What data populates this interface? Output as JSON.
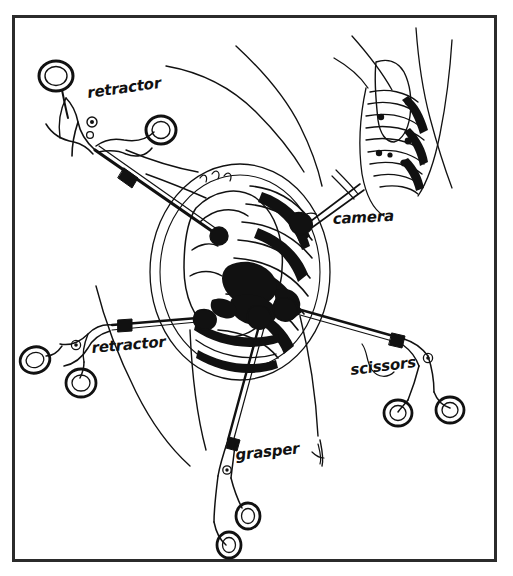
{
  "figure": {
    "kind": "line-drawing",
    "border_color": "#2b2b2b",
    "ink_color": "#111111",
    "background_color": "#ffffff",
    "frame": {
      "x": 13,
      "y": 16,
      "width": 483,
      "height": 545
    }
  },
  "labels": [
    {
      "id": "retractor-upper",
      "text": "retractor",
      "x": 88,
      "y": 98,
      "rotation": -8,
      "font_size": 15
    },
    {
      "id": "camera",
      "text": "camera",
      "x": 333,
      "y": 224,
      "rotation": -3,
      "font_size": 15
    },
    {
      "id": "retractor-lower",
      "text": "retractor",
      "x": 92,
      "y": 353,
      "rotation": -5,
      "font_size": 15
    },
    {
      "id": "scissors",
      "text": "scissors",
      "x": 351,
      "y": 375,
      "rotation": -7,
      "font_size": 15
    },
    {
      "id": "grasper",
      "text": "grasper",
      "x": 236,
      "y": 460,
      "rotation": -6,
      "font_size": 15
    }
  ],
  "instruments": [
    {
      "id": "retractor-upper",
      "name": "retractor",
      "handle_position": "top-left",
      "handle_type": "ring-handle",
      "ring_count": 2,
      "entry_point": {
        "x": 219,
        "y": 236
      }
    },
    {
      "id": "retractor-lower",
      "name": "retractor",
      "handle_position": "bottom-left",
      "handle_type": "ring-handle",
      "ring_count": 2,
      "entry_point": {
        "x": 210,
        "y": 317
      }
    },
    {
      "id": "grasper",
      "name": "grasper",
      "handle_position": "bottom-center",
      "handle_type": "ring-handle",
      "ring_count": 2,
      "entry_point": {
        "x": 262,
        "y": 315
      }
    },
    {
      "id": "scissors",
      "name": "scissors",
      "handle_position": "bottom-right",
      "handle_type": "ring-handle",
      "ring_count": 2,
      "entry_point": {
        "x": 287,
        "y": 306
      }
    },
    {
      "id": "camera",
      "name": "camera",
      "handle_position": "right",
      "handle_type": "straight-shaft",
      "ring_count": 0,
      "entry_point": {
        "x": 307,
        "y": 224
      }
    }
  ],
  "anatomy": {
    "main_view": {
      "id": "operative-field",
      "description": "chest cavity with ribs and lung, instruments converging"
    },
    "inset_view": {
      "id": "torso-inset",
      "description": "lateral torso with rib cage and port sites",
      "rib_count": 9,
      "port_marker_count": 5
    },
    "body_outline": {
      "id": "patient-torso-outline",
      "description": "shoulder and flank contour lines"
    }
  }
}
